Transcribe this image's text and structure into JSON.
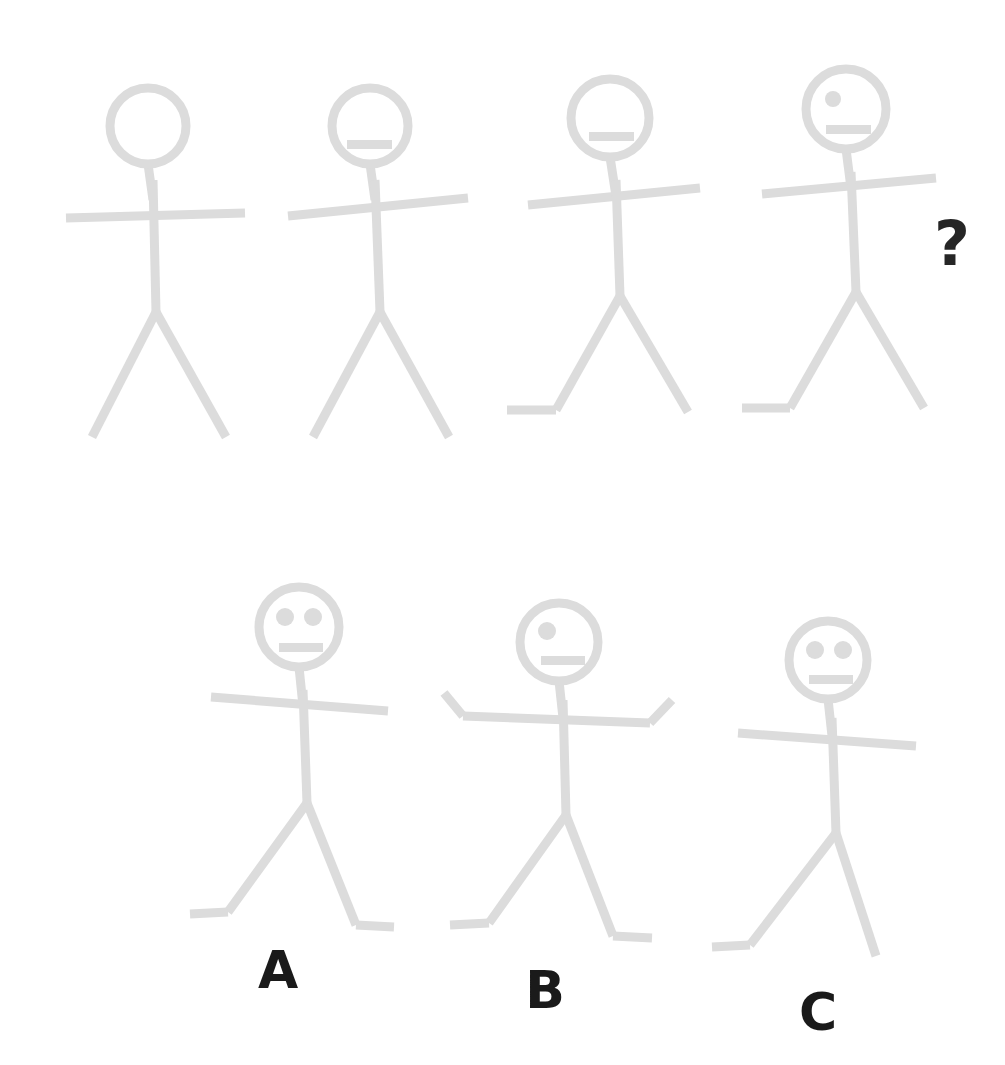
{
  "puzzle": {
    "title": "Stick figure sequence matrix",
    "background_color": "#ffffff",
    "figure_color": "#dcdcdc",
    "label_color": "#1a1a1a",
    "question_mark": "?",
    "question_mark_position": {
      "x": 952,
      "y": 265
    }
  },
  "sequence": {
    "name": "sequence-row",
    "figures": [
      {
        "id": "sequence-figure-1",
        "index": 1,
        "head": {
          "cx": 148,
          "cy": 126,
          "r": 38
        },
        "eyes": [],
        "mouth": null,
        "neck": {
          "x1": 148,
          "y1": 164,
          "x2": 153,
          "y2": 200
        },
        "spine": {
          "x1": 153,
          "y1": 180,
          "x2": 156,
          "y2": 312
        },
        "arms": {
          "x1": 66,
          "y1": 218,
          "x2": 245,
          "y2": 213
        },
        "left_leg": {
          "x1": 156,
          "y1": 312,
          "x2": 92,
          "y2": 437
        },
        "right_leg": {
          "x1": 156,
          "y1": 312,
          "x2": 226,
          "y2": 437
        },
        "left_foot": null,
        "right_foot": null,
        "left_hand": null,
        "right_hand": null
      },
      {
        "id": "sequence-figure-2",
        "index": 2,
        "head": {
          "cx": 370,
          "cy": 126,
          "r": 38
        },
        "eyes": [],
        "mouth": {
          "x": 347,
          "y": 140,
          "w": 45,
          "h": 9
        },
        "neck": {
          "x1": 370,
          "y1": 164,
          "x2": 375,
          "y2": 200
        },
        "spine": {
          "x1": 375,
          "y1": 180,
          "x2": 380,
          "y2": 312
        },
        "arms": {
          "x1": 288,
          "y1": 216,
          "x2": 468,
          "y2": 198
        },
        "left_leg": {
          "x1": 380,
          "y1": 312,
          "x2": 313,
          "y2": 437
        },
        "right_leg": {
          "x1": 380,
          "y1": 312,
          "x2": 449,
          "y2": 437
        },
        "left_foot": null,
        "right_foot": null,
        "left_hand": null,
        "right_hand": null
      },
      {
        "id": "sequence-figure-3",
        "index": 3,
        "head": {
          "cx": 610,
          "cy": 118,
          "r": 39
        },
        "eyes": [],
        "mouth": {
          "x": 589,
          "y": 132,
          "w": 45,
          "h": 9
        },
        "neck": {
          "x1": 610,
          "y1": 157,
          "x2": 616,
          "y2": 196
        },
        "spine": {
          "x1": 616,
          "y1": 180,
          "x2": 620,
          "y2": 296
        },
        "arms": {
          "x1": 528,
          "y1": 205,
          "x2": 700,
          "y2": 188
        },
        "left_leg": {
          "x1": 620,
          "y1": 296,
          "x2": 556,
          "y2": 410
        },
        "right_leg": {
          "x1": 620,
          "y1": 296,
          "x2": 688,
          "y2": 412
        },
        "left_foot": {
          "x1": 556,
          "y1": 410,
          "x2": 507,
          "y2": 410
        },
        "right_foot": null,
        "left_hand": null,
        "right_hand": null
      },
      {
        "id": "sequence-figure-4",
        "index": 4,
        "head": {
          "cx": 846,
          "cy": 109,
          "r": 40
        },
        "eyes": [
          {
            "cx": 833,
            "cy": 99,
            "r": 8
          }
        ],
        "mouth": {
          "x": 826,
          "y": 125,
          "w": 45,
          "h": 9
        },
        "neck": {
          "x1": 846,
          "y1": 149,
          "x2": 851,
          "y2": 188
        },
        "spine": {
          "x1": 851,
          "y1": 172,
          "x2": 856,
          "y2": 292
        },
        "arms": {
          "x1": 762,
          "y1": 194,
          "x2": 936,
          "y2": 178
        },
        "left_leg": {
          "x1": 856,
          "y1": 292,
          "x2": 790,
          "y2": 408
        },
        "right_leg": {
          "x1": 856,
          "y1": 292,
          "x2": 924,
          "y2": 408
        },
        "left_foot": {
          "x1": 790,
          "y1": 408,
          "x2": 742,
          "y2": 408
        },
        "right_foot": null,
        "left_hand": null,
        "right_hand": null
      }
    ]
  },
  "options": {
    "name": "answer-options-row",
    "items": [
      {
        "id": "option-a",
        "label": "A",
        "label_x": 278,
        "label_y": 988,
        "head": {
          "cx": 299,
          "cy": 627,
          "r": 40
        },
        "eyes": [
          {
            "cx": 285,
            "cy": 617,
            "r": 9
          },
          {
            "cx": 313,
            "cy": 617,
            "r": 9
          }
        ],
        "mouth": {
          "x": 279,
          "y": 643,
          "w": 44,
          "h": 9
        },
        "neck": {
          "x1": 299,
          "y1": 667,
          "x2": 303,
          "y2": 706
        },
        "spine": {
          "x1": 303,
          "y1": 690,
          "x2": 307,
          "y2": 803
        },
        "arms": {
          "x1": 211,
          "y1": 697,
          "x2": 388,
          "y2": 711
        },
        "left_leg": {
          "x1": 307,
          "y1": 803,
          "x2": 228,
          "y2": 912
        },
        "right_leg": {
          "x1": 307,
          "y1": 803,
          "x2": 356,
          "y2": 925
        },
        "left_foot": {
          "x1": 228,
          "y1": 912,
          "x2": 190,
          "y2": 914
        },
        "right_foot": {
          "x1": 356,
          "y1": 925,
          "x2": 394,
          "y2": 927
        },
        "left_hand": null,
        "right_hand": null
      },
      {
        "id": "option-b",
        "label": "B",
        "label_x": 545,
        "label_y": 1008,
        "head": {
          "cx": 559,
          "cy": 642,
          "r": 39
        },
        "eyes": [
          {
            "cx": 547,
            "cy": 631,
            "r": 9
          }
        ],
        "mouth": {
          "x": 541,
          "y": 656,
          "w": 44,
          "h": 9
        },
        "neck": {
          "x1": 559,
          "y1": 681,
          "x2": 563,
          "y2": 718
        },
        "spine": {
          "x1": 563,
          "y1": 700,
          "x2": 566,
          "y2": 815
        },
        "arms": {
          "x1": 463,
          "y1": 716,
          "x2": 650,
          "y2": 723
        },
        "left_leg": {
          "x1": 566,
          "y1": 815,
          "x2": 489,
          "y2": 923
        },
        "right_leg": {
          "x1": 566,
          "y1": 815,
          "x2": 613,
          "y2": 936
        },
        "left_foot": {
          "x1": 489,
          "y1": 923,
          "x2": 450,
          "y2": 925
        },
        "right_foot": {
          "x1": 613,
          "y1": 936,
          "x2": 652,
          "y2": 938
        },
        "left_hand": {
          "x1": 463,
          "y1": 716,
          "x2": 444,
          "y2": 693
        },
        "right_hand": {
          "x1": 650,
          "y1": 723,
          "x2": 672,
          "y2": 700
        }
      },
      {
        "id": "option-c",
        "label": "C",
        "label_x": 818,
        "label_y": 1030,
        "head": {
          "cx": 828,
          "cy": 660,
          "r": 39
        },
        "eyes": [
          {
            "cx": 815,
            "cy": 650,
            "r": 9
          },
          {
            "cx": 843,
            "cy": 650,
            "r": 9
          }
        ],
        "mouth": {
          "x": 809,
          "y": 675,
          "w": 44,
          "h": 9
        },
        "neck": {
          "x1": 828,
          "y1": 699,
          "x2": 832,
          "y2": 736
        },
        "spine": {
          "x1": 832,
          "y1": 718,
          "x2": 836,
          "y2": 833
        },
        "arms": {
          "x1": 738,
          "y1": 733,
          "x2": 916,
          "y2": 746
        },
        "left_leg": {
          "x1": 836,
          "y1": 833,
          "x2": 750,
          "y2": 945
        },
        "right_leg": {
          "x1": 836,
          "y1": 833,
          "x2": 876,
          "y2": 956
        },
        "left_foot": {
          "x1": 750,
          "y1": 945,
          "x2": 712,
          "y2": 947
        },
        "right_foot": null,
        "left_hand": null,
        "right_hand": null
      }
    ]
  }
}
